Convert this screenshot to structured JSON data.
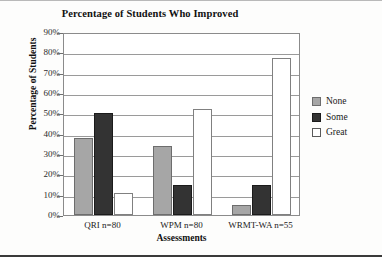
{
  "chart_data": {
    "type": "bar",
    "title": "Percentage of Students Who Improved",
    "xlabel": "Assessments",
    "ylabel": "Percentage of Students",
    "categories": [
      "QRI n=80",
      "WPM n=80",
      "WRMT-WA n=55"
    ],
    "series": [
      {
        "name": "None",
        "values": [
          38,
          34,
          5
        ],
        "color": "#a6a6a6"
      },
      {
        "name": "Some",
        "values": [
          50,
          15,
          15
        ],
        "color": "#333333"
      },
      {
        "name": "Great",
        "values": [
          11,
          52,
          77
        ],
        "color": "#ffffff"
      }
    ],
    "ylim": [
      0,
      90
    ],
    "ytick_labels": [
      "90%",
      "80%",
      "70%",
      "60%",
      "50%",
      "40%",
      "30%",
      "20%",
      "10%",
      "0%"
    ],
    "ytick_values": [
      90,
      80,
      70,
      60,
      50,
      40,
      30,
      20,
      10,
      0
    ],
    "grid": true,
    "legend_position": "right",
    "legend_entries": [
      "None",
      "Some",
      "Great"
    ]
  }
}
